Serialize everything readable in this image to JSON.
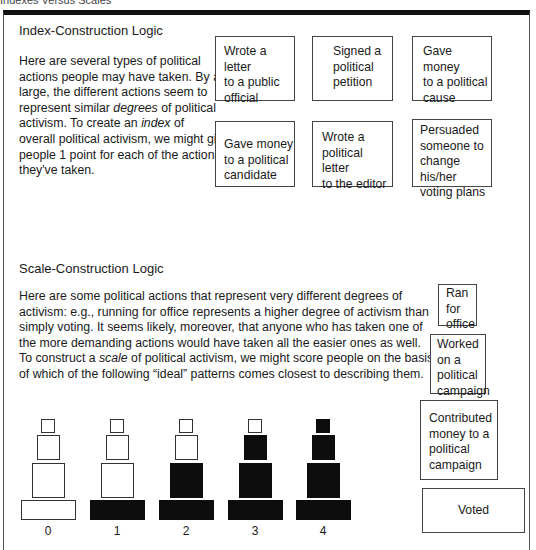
{
  "caption": "Indexes Versus Scales",
  "index_section": {
    "title": "Index-Construction Logic",
    "paragraph_lines": [
      "Here are several types of political",
      "actions people may have taken. By and",
      "large, the different actions seem to",
      "represent similar |degrees| of political",
      "activism. To create an |index| of",
      "overall political activism, we might give",
      "people 1 point for each of the actions",
      "they've taken."
    ],
    "actions": [
      {
        "label": "Wrote a letter\nto a public\nofficial"
      },
      {
        "label": "Signed a\npolitical\npetition"
      },
      {
        "label": "Gave money\nto a political\ncause"
      },
      {
        "label": "Gave money\nto a political\ncandidate"
      },
      {
        "label": "Wrote a\npolitical letter\nto the editor"
      },
      {
        "label": "Persuaded\nsomeone to\nchange his/her\nvoting plans"
      }
    ]
  },
  "scale_section": {
    "title": "Scale-Construction Logic",
    "paragraph_lines": [
      "Here are some political actions that represent very different degrees of",
      "activism: e.g., running for office represents a higher degree of activism than",
      "simply voting. It seems likely, moreover, that anyone who has taken one of",
      "the more demanding actions would have taken all the easier ones as well.",
      "To construct a |scale| of political activism, we might score people on the basis",
      "of which of the following “ideal” patterns comes closest to describing them."
    ],
    "pyramid_levels": [
      {
        "label": "Ran\nfor\noffice"
      },
      {
        "label": "Worked\non a\npolitical\ncampaign"
      },
      {
        "label": "Contributed\nmoney to a\npolitical\ncampaign"
      },
      {
        "label": "Voted"
      }
    ],
    "patterns": [
      {
        "score": "0",
        "filled_levels": 0
      },
      {
        "score": "1",
        "filled_levels": 1
      },
      {
        "score": "2",
        "filled_levels": 2
      },
      {
        "score": "3",
        "filled_levels": 3
      },
      {
        "score": "4",
        "filled_levels": 4
      }
    ]
  },
  "colors": {
    "filled": "#0d0d0d",
    "border": "#444444",
    "background": "#ffffff"
  }
}
